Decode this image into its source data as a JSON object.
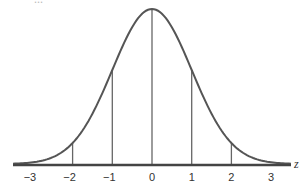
{
  "header": {
    "cutoff_text": "..."
  },
  "chart_data": {
    "type": "line",
    "xlabel": "z",
    "ylabel": "",
    "x_ticks": [
      -3,
      -2,
      -1,
      0,
      1,
      2,
      3
    ],
    "tick_labels": [
      "−3",
      "−2",
      "−1",
      "0",
      "1",
      "2",
      "3"
    ],
    "xlim": [
      -3.5,
      3.5
    ],
    "grid": false,
    "legend": null,
    "series": [
      {
        "name": "N(0,1) density",
        "mean": 0,
        "sd": 1,
        "x": [
          -3,
          -2,
          -1,
          0,
          1,
          2,
          3
        ],
        "values": [
          0.0044,
          0.054,
          0.242,
          0.399,
          0.242,
          0.054,
          0.0044
        ]
      }
    ],
    "vertical_lines_at": [
      -2,
      -1,
      0,
      1,
      2
    ],
    "colors": {
      "curve": "#555555",
      "axis": "#444444",
      "lines": "#666666"
    }
  }
}
